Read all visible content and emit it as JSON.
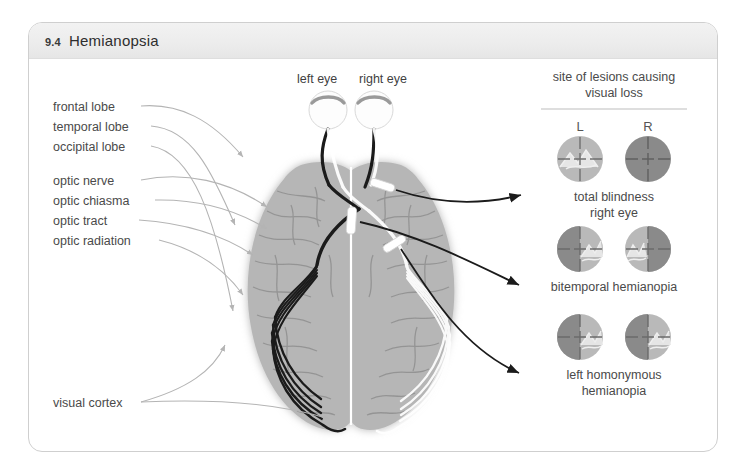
{
  "figure": {
    "number": "9.4",
    "title": "Hemianopsia"
  },
  "anatomy_labels": [
    {
      "id": "frontal-lobe",
      "text": "frontal lobe"
    },
    {
      "id": "temporal-lobe",
      "text": "temporal lobe"
    },
    {
      "id": "occipital-lobe",
      "text": "occipital lobe"
    },
    {
      "id": "optic-nerve",
      "text": "optic nerve"
    },
    {
      "id": "optic-chiasma",
      "text": "optic chiasma"
    },
    {
      "id": "optic-tract",
      "text": "optic tract"
    },
    {
      "id": "optic-radiation",
      "text": "optic radiation"
    },
    {
      "id": "visual-cortex",
      "text": "visual cortex"
    }
  ],
  "eyes": {
    "left_label": "left eye",
    "right_label": "right eye"
  },
  "lesion_panel": {
    "heading_line1": "site of lesions causing",
    "heading_line2": "visual loss",
    "column_left": "L",
    "column_right": "R",
    "rows": [
      {
        "id": "total-blindness-right-eye",
        "caption_line1": "total blindness",
        "caption_line2": "right eye",
        "left_field": {
          "left_half": "seeing",
          "right_half": "seeing"
        },
        "right_field": {
          "left_half": "blind",
          "right_half": "blind"
        }
      },
      {
        "id": "bitemporal-hemianopia",
        "caption_line1": "bitemporal hemianopia",
        "caption_line2": "",
        "left_field": {
          "left_half": "blind",
          "right_half": "seeing"
        },
        "right_field": {
          "left_half": "seeing",
          "right_half": "blind"
        }
      },
      {
        "id": "left-homonymous-hemianopia",
        "caption_line1": "left homonymous",
        "caption_line2": "hemianopia",
        "left_field": {
          "left_half": "blind",
          "right_half": "seeing"
        },
        "right_field": {
          "left_half": "blind",
          "right_half": "seeing"
        }
      }
    ]
  },
  "colors": {
    "card_border": "#cfcfcf",
    "header_band": "#ececec",
    "brain_fill": "#b6b6b6",
    "brain_sulci": "#8f8f8f",
    "pathway_dark": "#1b1b1b",
    "pathway_light": "#ffffff",
    "field_seeing": "#b9b9b9",
    "field_blind": "#8a8a8a",
    "leader_line": "#b4b4b4",
    "label_text": "#4a4a4a"
  }
}
